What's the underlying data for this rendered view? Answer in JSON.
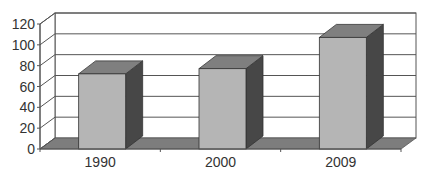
{
  "chart_data": {
    "type": "bar",
    "style": "3d-column",
    "title": "",
    "xlabel": "",
    "ylabel": "",
    "categories": [
      "1990",
      "2000",
      "2009"
    ],
    "values": [
      75,
      80,
      110
    ],
    "ylim": [
      0,
      120
    ],
    "yticks": [
      0,
      20,
      40,
      60,
      80,
      100,
      120
    ],
    "ytick_labels": [
      "0",
      "20",
      "40",
      "60",
      "80",
      "100",
      "120"
    ],
    "grid": true,
    "legend": null
  },
  "colors": {
    "bar_front": "#b5b5b5",
    "bar_top": "#7f7f7f",
    "bar_side": "#474747",
    "floor": "#7d7d7d",
    "gridline": "#555555",
    "text": "#333333"
  }
}
